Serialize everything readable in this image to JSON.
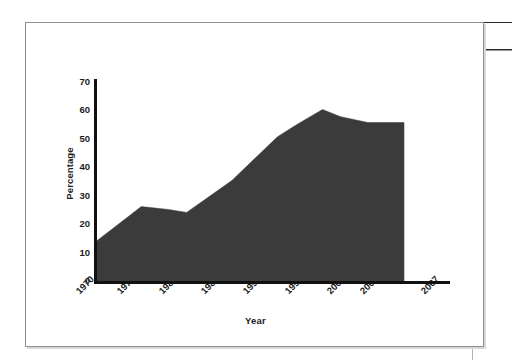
{
  "figure": {
    "background_color": "#ffffff",
    "frame_color": "#8f8f8f"
  },
  "chart_data": {
    "type": "area",
    "title": "",
    "subtitle": "",
    "xlabel": "Year",
    "ylabel": "Percentage",
    "series_color": "#3b3b3b",
    "axis_color": "#111111",
    "grid": false,
    "legend": false,
    "xlim": [
      1970,
      2007
    ],
    "ylim": [
      0,
      70
    ],
    "ytick_labels": [
      "0",
      "10",
      "20",
      "30",
      "40",
      "50",
      "60",
      "70"
    ],
    "yticks": [
      0,
      10,
      20,
      30,
      40,
      50,
      60,
      70
    ],
    "xtick_labels": [
      "1970",
      "1975",
      "1980",
      "1985",
      "1990",
      "1995",
      "2000",
      "2004",
      "2007"
    ],
    "xticks": [
      1970,
      1975,
      1980,
      1985,
      1990,
      1995,
      2000,
      2004,
      2007
    ],
    "x": [
      1970,
      1975,
      1978,
      1980,
      1985,
      1990,
      1992,
      1995,
      1997,
      2000,
      2004
    ],
    "values": [
      14,
      26,
      25,
      24,
      35,
      50,
      54,
      59.5,
      57,
      55,
      55
    ],
    "series": [
      {
        "name": "Percentage",
        "values": [
          14,
          26,
          25,
          24,
          35,
          50,
          54,
          59.5,
          57,
          55,
          55
        ]
      }
    ],
    "annotations": []
  }
}
